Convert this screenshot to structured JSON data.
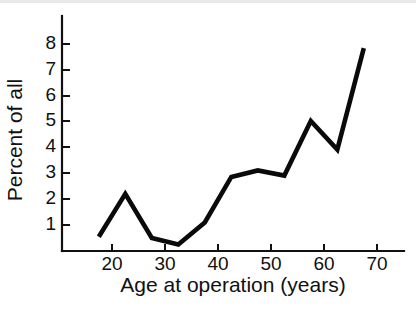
{
  "figure": {
    "background_color": "#ffffff",
    "line_color": "#0a0a0a",
    "axis_color": "#111111"
  },
  "chart_data": {
    "type": "line",
    "title": "",
    "xlabel": "Age at operation (years)",
    "ylabel": "Percent of all",
    "xlim": [
      14,
      73
    ],
    "ylim": [
      0,
      8.6
    ],
    "grid": false,
    "legend": null,
    "xticks": [
      20,
      30,
      40,
      50,
      60,
      70
    ],
    "xtick_labels": [
      "20",
      "30",
      "40",
      "50",
      "60",
      "70"
    ],
    "yticks": [
      1,
      2,
      3,
      4,
      5,
      6,
      7,
      8
    ],
    "ytick_labels": [
      "1",
      "2",
      "3",
      "4",
      "5",
      "6",
      "7",
      "8"
    ],
    "x": [
      17.5,
      22.5,
      27.5,
      32.5,
      37.5,
      42.5,
      47.5,
      52.5,
      57.5,
      62.5,
      67.5
    ],
    "values": [
      0.55,
      2.2,
      0.5,
      0.25,
      1.1,
      2.85,
      3.1,
      2.9,
      5.0,
      3.9,
      7.8
    ],
    "series": [
      {
        "name": "Percent of all",
        "x": [
          17.5,
          22.5,
          27.5,
          32.5,
          37.5,
          42.5,
          47.5,
          52.5,
          57.5,
          62.5,
          67.5
        ],
        "values": [
          0.55,
          2.2,
          0.5,
          0.25,
          1.1,
          2.85,
          3.1,
          2.9,
          5.0,
          3.9,
          7.8
        ]
      }
    ],
    "annotations": []
  },
  "axis_titles": {
    "x": "Age at operation (years)",
    "y": "Percent of all"
  }
}
